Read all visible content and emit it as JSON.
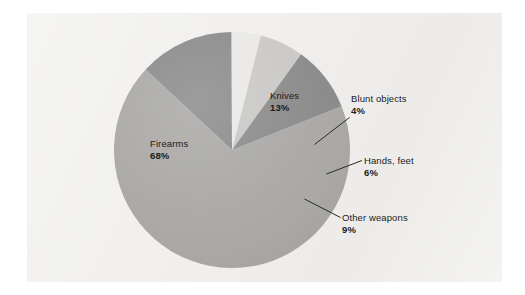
{
  "figure": {
    "panel_background": "#f1f0ee",
    "page_background": "#ffffff"
  },
  "chart_data": {
    "type": "pie",
    "title": "",
    "subtitle": "",
    "xlabel": "",
    "ylabel": "",
    "legend_position": "none",
    "grid": false,
    "units": "percent",
    "total": 100,
    "start_angle_deg": -47,
    "direction": "clockwise",
    "categories": [
      "Knives",
      "Blunt objects",
      "Hands, feet",
      "Other weapons",
      "Firearms"
    ],
    "values": [
      13,
      4,
      6,
      9,
      68
    ],
    "colors": [
      "#8a8a8a",
      "#e9e8e6",
      "#c9c8c6",
      "#8a8a8a",
      "#a9a8a6"
    ],
    "slices": [
      {
        "name": "Knives",
        "label": "Knives",
        "value": 13,
        "value_label": "13%",
        "color": "#8a8a8a",
        "label_placement": "inside",
        "leader_line": false
      },
      {
        "name": "Blunt objects",
        "label": "Blunt objects",
        "value": 4,
        "value_label": "4%",
        "color": "#e9e8e6",
        "label_placement": "outside",
        "leader_line": true
      },
      {
        "name": "Hands, feet",
        "label": "Hands, feet",
        "value": 6,
        "value_label": "6%",
        "color": "#c9c8c6",
        "label_placement": "outside",
        "leader_line": true
      },
      {
        "name": "Other weapons",
        "label": "Other weapons",
        "value": 9,
        "value_label": "9%",
        "color": "#8a8a8a",
        "label_placement": "outside",
        "leader_line": true
      },
      {
        "name": "Firearms",
        "label": "Firearms",
        "value": 68,
        "value_label": "68%",
        "color": "#a9a8a6",
        "label_placement": "inside",
        "leader_line": false
      }
    ]
  }
}
